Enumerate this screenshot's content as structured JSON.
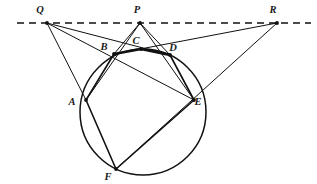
{
  "figure": {
    "type": "geometry-diagram",
    "canvas": {
      "width": 317,
      "height": 184,
      "background": "#ffffff"
    },
    "stroke_color": "#111111",
    "circle": {
      "label": "circle",
      "cx": 143,
      "cy": 112,
      "r": 63
    },
    "dashed_line": {
      "label": "pascal-line",
      "x1": 17,
      "y1": 23,
      "x2": 311,
      "y2": 23,
      "dash": "7 5"
    },
    "points": [
      {
        "id": "Q",
        "label": "Q",
        "x": 47,
        "y": 23,
        "label_x": 40,
        "label_y": 13,
        "on_circle": false
      },
      {
        "id": "P",
        "label": "P",
        "x": 140,
        "y": 23,
        "label_x": 137,
        "label_y": 13,
        "on_circle": false
      },
      {
        "id": "R",
        "label": "R",
        "x": 277,
        "y": 23,
        "label_x": 273,
        "label_y": 13,
        "on_circle": false
      },
      {
        "id": "B",
        "label": "B",
        "x": 114,
        "y": 54,
        "label_x": 104,
        "label_y": 50,
        "on_circle": true
      },
      {
        "id": "C",
        "label": "C",
        "x": 141,
        "y": 49,
        "label_x": 136,
        "label_y": 44,
        "on_circle": true
      },
      {
        "id": "D",
        "label": "D",
        "x": 170,
        "y": 55,
        "label_x": 173,
        "label_y": 51,
        "on_circle": true
      },
      {
        "id": "A",
        "label": "A",
        "x": 86,
        "y": 100,
        "label_x": 72,
        "label_y": 105,
        "on_circle": true
      },
      {
        "id": "E",
        "label": "E",
        "x": 194,
        "y": 100,
        "label_x": 198,
        "label_y": 105,
        "on_circle": true
      },
      {
        "id": "F",
        "label": "F",
        "x": 116,
        "y": 169,
        "label_x": 108,
        "label_y": 180,
        "on_circle": true
      }
    ],
    "segments": [
      {
        "name": "Q-A",
        "from": "Q",
        "to": "A",
        "weight": 1.0
      },
      {
        "name": "Q-D",
        "from": "Q",
        "to": "D",
        "weight": 1.0
      },
      {
        "name": "Q-E",
        "from": "Q",
        "to": "E",
        "weight": 1.0
      },
      {
        "name": "P-B",
        "from": "P",
        "to": "B",
        "weight": 1.0
      },
      {
        "name": "P-A",
        "from": "P",
        "to": "A",
        "weight": 1.0
      },
      {
        "name": "P-D",
        "from": "P",
        "to": "D",
        "weight": 1.0
      },
      {
        "name": "P-E",
        "from": "P",
        "to": "E",
        "weight": 1.0
      },
      {
        "name": "R-B",
        "from": "R",
        "to": "B",
        "weight": 1.0
      },
      {
        "name": "R-F",
        "from": "R",
        "to": "F",
        "weight": 1.0
      },
      {
        "name": "A-B",
        "from": "A",
        "to": "B",
        "weight": 1.6
      },
      {
        "name": "B-C",
        "from": "B",
        "to": "C",
        "weight": 2.6
      },
      {
        "name": "C-D",
        "from": "C",
        "to": "D",
        "weight": 2.6
      },
      {
        "name": "D-E",
        "from": "D",
        "to": "E",
        "weight": 1.6
      },
      {
        "name": "A-F",
        "from": "A",
        "to": "F",
        "weight": 1.6
      },
      {
        "name": "E-F",
        "from": "E",
        "to": "F",
        "weight": 1.6
      }
    ],
    "vertex_markers": [
      "Q",
      "P",
      "R",
      "A",
      "B",
      "C",
      "D",
      "E",
      "F"
    ]
  }
}
